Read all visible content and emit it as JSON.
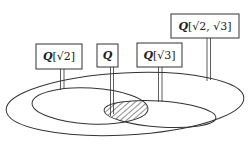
{
  "diagram": {
    "type": "field-extension-lattice-ellipses",
    "labels": {
      "q_sqrt2": {
        "field": "Q",
        "ext": "[√2]"
      },
      "q": {
        "field": "Q",
        "ext": ""
      },
      "q_sqrt3": {
        "field": "Q",
        "ext": "[√3]"
      },
      "q_sqrt2_sqrt3": {
        "field": "Q",
        "ext": "[√2, √3]"
      }
    },
    "regions": [
      {
        "name": "outer",
        "label_ref": "q_sqrt2_sqrt3"
      },
      {
        "name": "left-inner",
        "label_ref": "q_sqrt2"
      },
      {
        "name": "right-inner",
        "label_ref": "q_sqrt3"
      },
      {
        "name": "intersection-hatched",
        "label_ref": "q"
      }
    ],
    "colors": {
      "stroke": "#333333",
      "background": "#ffffff",
      "hatch": "#444444"
    }
  }
}
